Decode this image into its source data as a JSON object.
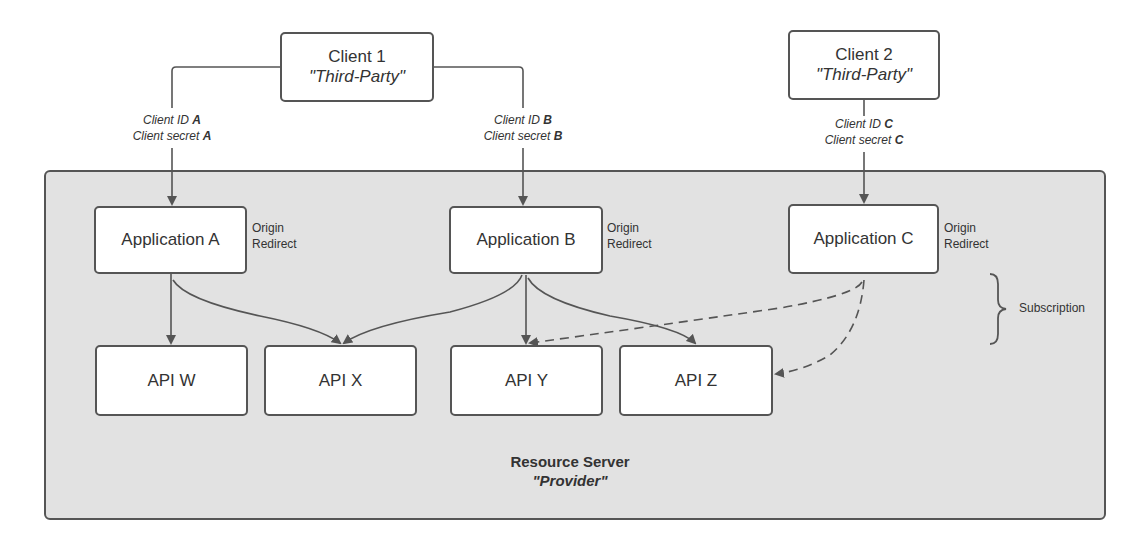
{
  "clients": [
    {
      "name": "Client 1",
      "role": "\"Third-Party\""
    },
    {
      "name": "Client 2",
      "role": "\"Third-Party\""
    }
  ],
  "credentials": [
    {
      "id_label": "Client ID",
      "id_key": "A",
      "secret_label": "Client secret",
      "secret_key": "A"
    },
    {
      "id_label": "Client ID",
      "id_key": "B",
      "secret_label": "Client secret",
      "secret_key": "B"
    },
    {
      "id_label": "Client ID",
      "id_key": "C",
      "secret_label": "Client secret",
      "secret_key": "C"
    }
  ],
  "applications": [
    {
      "name": "Application A",
      "note_line1": "Origin",
      "note_line2": "Redirect"
    },
    {
      "name": "Application B",
      "note_line1": "Origin",
      "note_line2": "Redirect"
    },
    {
      "name": "Application C",
      "note_line1": "Origin",
      "note_line2": "Redirect"
    }
  ],
  "apis": [
    {
      "name": "API W"
    },
    {
      "name": "API X"
    },
    {
      "name": "API Y"
    },
    {
      "name": "API Z"
    }
  ],
  "subscription_label": "Subscription",
  "resource_server": {
    "title": "Resource Server",
    "role": "\"Provider\""
  },
  "colors": {
    "container_bg": "#e2e2e2",
    "stroke": "#555555",
    "box_bg": "#ffffff"
  }
}
